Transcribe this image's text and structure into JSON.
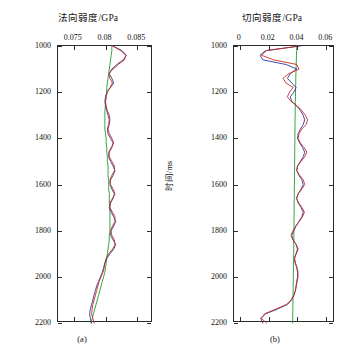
{
  "figure": {
    "panel_a": {
      "title": "法向弱度/GPa",
      "caption": "(a)",
      "ylabel": "时间/ms"
    },
    "panel_b": {
      "title": "切向弱度/GPa",
      "caption": "(b)",
      "ylabel": "时间/ms"
    }
  },
  "chart_data": [
    {
      "type": "line",
      "id": "panel-a",
      "title": "法向弱度/GPa",
      "caption": "(a)",
      "xlabel": "法向弱度/GPa",
      "ylabel": "时间/ms",
      "xlim": [
        0.0725,
        0.0875
      ],
      "ylim": [
        1000,
        2200
      ],
      "y_inverted": true,
      "xticks": [
        0.075,
        0.08,
        0.085
      ],
      "xticklabels": [
        "0.075",
        "0.08",
        "0.085"
      ],
      "yticks": [
        1000,
        1200,
        1400,
        1600,
        1800,
        2000,
        2200
      ],
      "yticklabels": [
        "1000",
        "1200",
        "1400",
        "1600",
        "1800",
        "2000",
        "2200"
      ],
      "grid": false,
      "legend": null,
      "series": [
        {
          "name": "true-model",
          "color": "#1f9b27",
          "width": 0.9,
          "x": [
            0.081,
            0.081,
            0.0809,
            0.0808,
            0.0807,
            0.0806,
            0.0805,
            0.0804,
            0.0803,
            0.0802,
            0.0802,
            0.0801,
            0.08,
            0.08,
            0.0799,
            0.0799,
            0.0799,
            0.0799,
            0.0799,
            0.08,
            0.0801,
            0.0801,
            0.0802,
            0.0802,
            0.0803,
            0.0803,
            0.0804,
            0.0804,
            0.0804,
            0.0805,
            0.0805,
            0.0805,
            0.0806,
            0.0806,
            0.0806,
            0.0807,
            0.0807,
            0.0807,
            0.0807,
            0.0807,
            0.0807,
            0.0806,
            0.0806,
            0.0805,
            0.0804,
            0.0803,
            0.0802,
            0.0801,
            0.08,
            0.0799,
            0.0797,
            0.0795,
            0.0793,
            0.0791,
            0.0789,
            0.0787,
            0.0785,
            0.0783,
            0.0781,
            0.0779,
            0.0777
          ],
          "y": [
            1000,
            1020,
            1040,
            1060,
            1080,
            1100,
            1120,
            1140,
            1160,
            1180,
            1200,
            1220,
            1240,
            1260,
            1280,
            1300,
            1320,
            1340,
            1360,
            1380,
            1400,
            1420,
            1440,
            1460,
            1480,
            1500,
            1520,
            1540,
            1560,
            1580,
            1600,
            1620,
            1640,
            1660,
            1680,
            1700,
            1720,
            1740,
            1760,
            1780,
            1800,
            1820,
            1840,
            1860,
            1880,
            1900,
            1920,
            1940,
            1960,
            1980,
            2000,
            2020,
            2040,
            2060,
            2080,
            2100,
            2120,
            2140,
            2160,
            2180,
            2200
          ]
        },
        {
          "name": "inverted-blue",
          "color": "#2b3a9c",
          "width": 0.9,
          "x": [
            0.0812,
            0.0826,
            0.0833,
            0.0828,
            0.0818,
            0.081,
            0.0806,
            0.081,
            0.0813,
            0.0808,
            0.0802,
            0.08,
            0.0799,
            0.08,
            0.0802,
            0.0804,
            0.0806,
            0.0805,
            0.0803,
            0.0804,
            0.0808,
            0.0812,
            0.081,
            0.0806,
            0.0805,
            0.0808,
            0.0812,
            0.0815,
            0.0812,
            0.0808,
            0.0807,
            0.081,
            0.0814,
            0.0812,
            0.0808,
            0.0806,
            0.0809,
            0.0813,
            0.0816,
            0.0813,
            0.0809,
            0.0808,
            0.0812,
            0.0816,
            0.0813,
            0.0807,
            0.0802,
            0.0799,
            0.0797,
            0.0795,
            0.0792,
            0.0789,
            0.0786,
            0.0784,
            0.0782,
            0.078,
            0.0778,
            0.0776,
            0.0775,
            0.0776,
            0.0778
          ],
          "y": [
            1000,
            1020,
            1040,
            1060,
            1080,
            1100,
            1120,
            1140,
            1160,
            1180,
            1200,
            1220,
            1240,
            1260,
            1280,
            1300,
            1320,
            1340,
            1360,
            1380,
            1400,
            1420,
            1440,
            1460,
            1480,
            1500,
            1520,
            1540,
            1560,
            1580,
            1600,
            1620,
            1640,
            1660,
            1680,
            1700,
            1720,
            1740,
            1760,
            1780,
            1800,
            1820,
            1840,
            1860,
            1880,
            1900,
            1920,
            1940,
            1960,
            1980,
            2000,
            2020,
            2040,
            2060,
            2080,
            2100,
            2120,
            2140,
            2160,
            2180,
            2200
          ]
        },
        {
          "name": "inverted-red",
          "color": "#cc2b1f",
          "width": 0.9,
          "x": [
            0.0811,
            0.0824,
            0.0832,
            0.083,
            0.082,
            0.0812,
            0.0805,
            0.0807,
            0.0811,
            0.0807,
            0.0803,
            0.0801,
            0.08,
            0.0801,
            0.0803,
            0.0806,
            0.0807,
            0.0806,
            0.0804,
            0.0806,
            0.081,
            0.0813,
            0.0809,
            0.0805,
            0.0806,
            0.081,
            0.0814,
            0.0814,
            0.081,
            0.0807,
            0.0808,
            0.0812,
            0.0815,
            0.0811,
            0.0807,
            0.0807,
            0.0811,
            0.0815,
            0.0815,
            0.0811,
            0.0808,
            0.081,
            0.0814,
            0.0815,
            0.0811,
            0.0805,
            0.0801,
            0.0799,
            0.0798,
            0.0796,
            0.0793,
            0.079,
            0.0788,
            0.0786,
            0.0784,
            0.0782,
            0.078,
            0.0779,
            0.0778,
            0.078,
            0.0782
          ],
          "y": [
            1000,
            1020,
            1040,
            1060,
            1080,
            1100,
            1120,
            1140,
            1160,
            1180,
            1200,
            1220,
            1240,
            1260,
            1280,
            1300,
            1320,
            1340,
            1360,
            1380,
            1400,
            1420,
            1440,
            1460,
            1480,
            1500,
            1520,
            1540,
            1560,
            1580,
            1600,
            1620,
            1640,
            1660,
            1680,
            1700,
            1720,
            1740,
            1760,
            1780,
            1800,
            1820,
            1840,
            1860,
            1880,
            1900,
            1920,
            1940,
            1960,
            1980,
            2000,
            2020,
            2040,
            2060,
            2080,
            2100,
            2120,
            2140,
            2160,
            2180,
            2200
          ]
        }
      ]
    },
    {
      "type": "line",
      "id": "panel-b",
      "title": "切向弱度/GPa",
      "caption": "(b)",
      "xlabel": "切向弱度/GPa",
      "ylabel": "时间/ms",
      "xlim": [
        -0.004,
        0.066
      ],
      "ylim": [
        1000,
        2200
      ],
      "y_inverted": true,
      "xticks": [
        0,
        0.02,
        0.04,
        0.06
      ],
      "xticklabels": [
        "0",
        "0.02",
        "0.04",
        "0.06"
      ],
      "yticks": [
        1000,
        1200,
        1400,
        1600,
        1800,
        2000,
        2200
      ],
      "yticklabels": [
        "1000",
        "1200",
        "1400",
        "1600",
        "1800",
        "2000",
        "2200"
      ],
      "grid": false,
      "legend": null,
      "series": [
        {
          "name": "true-model",
          "color": "#1f9b27",
          "width": 0.9,
          "x": [
            0.0395,
            0.0394,
            0.0393,
            0.0392,
            0.0391,
            0.039,
            0.0389,
            0.0388,
            0.0388,
            0.0387,
            0.0386,
            0.0386,
            0.0385,
            0.0385,
            0.0384,
            0.0384,
            0.0383,
            0.0383,
            0.0383,
            0.0382,
            0.0382,
            0.0382,
            0.0381,
            0.0381,
            0.0381,
            0.038,
            0.038,
            0.038,
            0.0379,
            0.0379,
            0.0379,
            0.0378,
            0.0378,
            0.0378,
            0.0377,
            0.0377,
            0.0377,
            0.0376,
            0.0376,
            0.0376,
            0.0375,
            0.0375,
            0.0375,
            0.0374,
            0.0374,
            0.0374,
            0.0373,
            0.0373,
            0.0372,
            0.0372,
            0.0371,
            0.0371,
            0.037,
            0.037,
            0.0369,
            0.0369,
            0.0368,
            0.0368,
            0.0367,
            0.0367,
            0.0366
          ],
          "y": [
            1000,
            1020,
            1040,
            1060,
            1080,
            1100,
            1120,
            1140,
            1160,
            1180,
            1200,
            1220,
            1240,
            1260,
            1280,
            1300,
            1320,
            1340,
            1360,
            1380,
            1400,
            1420,
            1440,
            1460,
            1480,
            1500,
            1520,
            1540,
            1560,
            1580,
            1600,
            1620,
            1640,
            1660,
            1680,
            1700,
            1720,
            1740,
            1760,
            1780,
            1800,
            1820,
            1840,
            1860,
            1880,
            1900,
            1920,
            1940,
            1960,
            1980,
            2000,
            2020,
            2040,
            2060,
            2080,
            2100,
            2120,
            2140,
            2160,
            2180,
            2200
          ]
        },
        {
          "name": "inverted-blue",
          "color": "#2b3a9c",
          "width": 0.9,
          "x": [
            0.042,
            0.018,
            0.014,
            0.016,
            0.032,
            0.0395,
            0.035,
            0.033,
            0.036,
            0.039,
            0.0375,
            0.035,
            0.036,
            0.0395,
            0.042,
            0.044,
            0.045,
            0.044,
            0.042,
            0.0405,
            0.04,
            0.0415,
            0.0435,
            0.045,
            0.044,
            0.042,
            0.04,
            0.0395,
            0.041,
            0.043,
            0.044,
            0.0425,
            0.0405,
            0.0395,
            0.0405,
            0.0425,
            0.044,
            0.043,
            0.041,
            0.039,
            0.0375,
            0.036,
            0.037,
            0.039,
            0.04,
            0.039,
            0.038,
            0.0385,
            0.0395,
            0.04,
            0.04,
            0.0395,
            0.039,
            0.0385,
            0.0375,
            0.036,
            0.033,
            0.026,
            0.018,
            0.0145,
            0.016
          ],
          "y": [
            1000,
            1020,
            1040,
            1060,
            1080,
            1100,
            1120,
            1140,
            1160,
            1180,
            1200,
            1220,
            1240,
            1260,
            1280,
            1300,
            1320,
            1340,
            1360,
            1380,
            1400,
            1420,
            1440,
            1460,
            1480,
            1500,
            1520,
            1540,
            1560,
            1580,
            1600,
            1620,
            1640,
            1660,
            1680,
            1700,
            1720,
            1740,
            1760,
            1780,
            1800,
            1820,
            1840,
            1860,
            1880,
            1900,
            1920,
            1940,
            1960,
            1980,
            2000,
            2020,
            2040,
            2060,
            2080,
            2100,
            2120,
            2140,
            2160,
            2180,
            2200
          ]
        },
        {
          "name": "inverted-red",
          "color": "#cc2b1f",
          "width": 0.9,
          "x": [
            0.041,
            0.0185,
            0.015,
            0.0235,
            0.0395,
            0.041,
            0.034,
            0.03,
            0.032,
            0.037,
            0.0345,
            0.033,
            0.0355,
            0.04,
            0.043,
            0.0455,
            0.047,
            0.046,
            0.043,
            0.041,
            0.0405,
            0.042,
            0.0445,
            0.0465,
            0.045,
            0.0425,
            0.04,
            0.0395,
            0.0415,
            0.044,
            0.045,
            0.043,
            0.0405,
            0.0392,
            0.0408,
            0.0432,
            0.0448,
            0.0435,
            0.0412,
            0.0388,
            0.037,
            0.0355,
            0.0368,
            0.0392,
            0.0405,
            0.0392,
            0.0378,
            0.0384,
            0.0398,
            0.0404,
            0.0404,
            0.0398,
            0.0392,
            0.0386,
            0.0374,
            0.0356,
            0.0322,
            0.025,
            0.0172,
            0.015,
            0.0185
          ],
          "y": [
            1000,
            1020,
            1040,
            1060,
            1080,
            1100,
            1120,
            1140,
            1160,
            1180,
            1200,
            1220,
            1240,
            1260,
            1280,
            1300,
            1320,
            1340,
            1360,
            1380,
            1400,
            1420,
            1440,
            1460,
            1480,
            1500,
            1520,
            1540,
            1560,
            1580,
            1600,
            1620,
            1640,
            1660,
            1680,
            1700,
            1720,
            1740,
            1760,
            1780,
            1800,
            1820,
            1840,
            1860,
            1880,
            1900,
            1920,
            1940,
            1960,
            1980,
            2000,
            2020,
            2040,
            2060,
            2080,
            2100,
            2120,
            2140,
            2160,
            2180,
            2200
          ]
        }
      ]
    }
  ]
}
